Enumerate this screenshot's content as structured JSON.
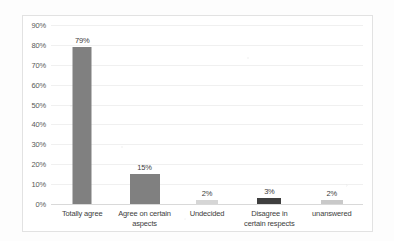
{
  "chart_data": {
    "type": "bar",
    "title": "",
    "subtitle": "",
    "xlabel": "",
    "ylabel": "",
    "categories": [
      "Totally agree",
      "Agree on certain aspects",
      "Undecided",
      "Disagree in certain respects",
      "unanswered"
    ],
    "values": [
      79,
      15,
      2,
      3,
      2
    ],
    "data_labels": [
      "79%",
      "15%",
      "2%",
      "3%",
      "2%"
    ],
    "bar_colors": [
      "#808080",
      "#808080",
      "#d6d6d6",
      "#3f3f3f",
      "#c9c9c9"
    ],
    "ylim": [
      0,
      90
    ],
    "ytick_values": [
      0,
      10,
      20,
      30,
      40,
      50,
      60,
      70,
      80,
      90
    ],
    "ytick_labels": [
      "0%",
      "10%",
      "20%",
      "30%",
      "40%",
      "50%",
      "60%",
      "70%",
      "80%",
      "90%"
    ],
    "grid": true,
    "legend": false,
    "legend_position": "none",
    "category_label_lines": [
      [
        "Totally agree"
      ],
      [
        "Agree on certain",
        "aspects"
      ],
      [
        "Undecided"
      ],
      [
        "Disagree in",
        "certain respects"
      ],
      [
        "unanswered"
      ]
    ],
    "axis_color": "#d9d9d9",
    "gridline_color": "#f0f0f0",
    "plot_background": "#ffffff"
  }
}
